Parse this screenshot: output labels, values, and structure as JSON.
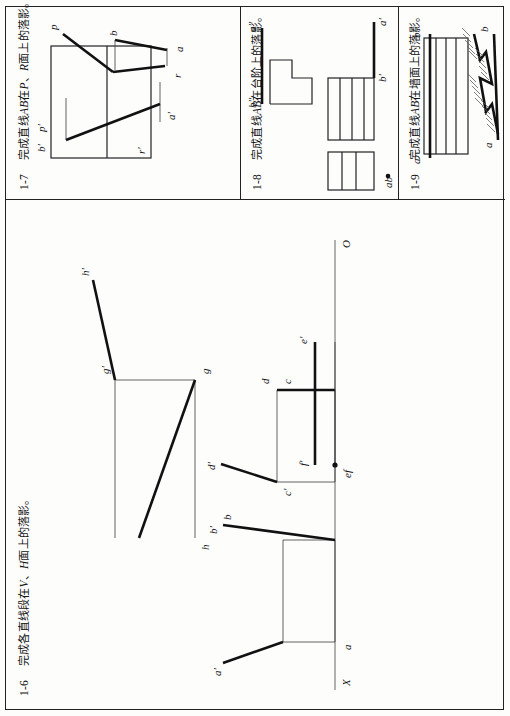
{
  "page": {
    "orientation": "landscape-sheet-rotated-90ccw",
    "background": "#fdfdfc",
    "ink": "#141414"
  },
  "panels": [
    {
      "id": "1-6",
      "number": "1-6",
      "title_cn": "完成各直线段在",
      "title_mid": "、",
      "title_cn2": "面上的落影。",
      "italic1": "V",
      "italic2": "H",
      "full_title": "1-6  完成各直线段在V、H面上的落影。",
      "axis_labels": {
        "x": "X",
        "o": "O"
      },
      "figures": [
        {
          "name": "segment-ab",
          "labels": [
            "a'",
            "b'",
            "a",
            "b"
          ]
        },
        {
          "name": "segment-cd",
          "labels": [
            "c'",
            "d'",
            "c",
            "d"
          ]
        },
        {
          "name": "segment-ef",
          "labels": [
            "e'",
            "f'",
            "ef"
          ]
        },
        {
          "name": "segment-gh",
          "labels": [
            "g'",
            "h'",
            "g",
            "h"
          ]
        }
      ]
    },
    {
      "id": "1-7",
      "number": "1-7",
      "title_cn": "完成直线",
      "title_mid": "在",
      "title_sep": "、",
      "title_cn2": "面上的落影。",
      "italic1": "AB",
      "italic2": "P",
      "italic3": "R",
      "full_title": "1-7  完成直线AB在P、R面上的落影。",
      "labels": [
        "b'",
        "p'",
        "r'",
        "a'",
        "p",
        "b",
        "r",
        "a"
      ]
    },
    {
      "id": "1-8",
      "number": "1-8",
      "title_cn": "完成直线",
      "title_mid": "在台阶上的落影。",
      "italic1": "AB",
      "full_title": "1-8  完成直线AB在台阶上的落影。",
      "labels": [
        "a''",
        "b''",
        "a'",
        "b'",
        "ab"
      ]
    },
    {
      "id": "1-9",
      "number": "1-9",
      "title_cn": "完成直线",
      "title_mid": "在墙面上的落影。",
      "italic1": "AB",
      "full_title": "1-9  完成直线AB在墙面上的落影。",
      "labels": [
        "b'",
        "a'",
        "b",
        "a"
      ]
    }
  ]
}
